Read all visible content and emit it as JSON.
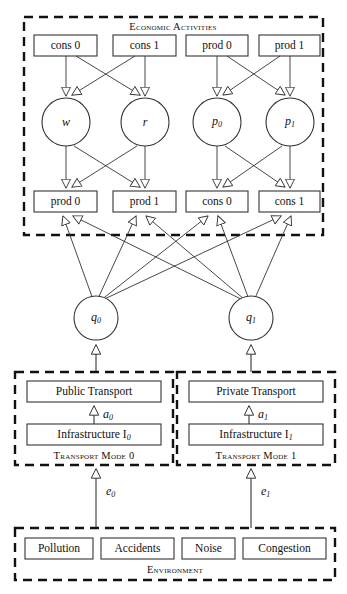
{
  "diagram": {
    "type": "block-flow-diagram",
    "stroke_color": "#333333",
    "dashed_border_color": "#1a1a1a",
    "background": "#ffffff",
    "groups": [
      {
        "id": "economic-activities",
        "title": "Economic Activities",
        "title_position": "top-center"
      },
      {
        "id": "transport-mode-0",
        "title": "Transport Mode 0",
        "title_position": "bottom-center"
      },
      {
        "id": "transport-mode-1",
        "title": "Transport Mode 1",
        "title_position": "bottom-center"
      },
      {
        "id": "environment",
        "title": "Environment",
        "title_position": "bottom-center"
      }
    ],
    "econ_top_row": [
      {
        "id": "cons0-top",
        "label": "cons 0"
      },
      {
        "id": "cons1-top",
        "label": "cons 1"
      },
      {
        "id": "prod0-top",
        "label": "prod 0"
      },
      {
        "id": "prod1-top",
        "label": "prod 1"
      }
    ],
    "econ_mid_row": [
      {
        "id": "w",
        "label": "w",
        "sub": ""
      },
      {
        "id": "r",
        "label": "r",
        "sub": ""
      },
      {
        "id": "p0",
        "label": "p",
        "sub": "0"
      },
      {
        "id": "p1",
        "label": "p",
        "sub": "1"
      }
    ],
    "econ_bottom_row": [
      {
        "id": "prod0-bot",
        "label": "prod 0"
      },
      {
        "id": "prod1-bot",
        "label": "prod 1"
      },
      {
        "id": "cons0-bot",
        "label": "cons 0"
      },
      {
        "id": "cons1-bot",
        "label": "cons 1"
      }
    ],
    "quantity_nodes": [
      {
        "id": "q0",
        "label": "q",
        "sub": "0"
      },
      {
        "id": "q1",
        "label": "q",
        "sub": "1"
      }
    ],
    "transport_modes": [
      {
        "id": "mode0",
        "service": "Public Transport",
        "infrastructure": "Infrastructure I",
        "infrastructure_sub": "0",
        "caption": "Transport Mode 0",
        "internal_edge_label": "a",
        "internal_edge_sub": "0"
      },
      {
        "id": "mode1",
        "service": "Private Transport",
        "infrastructure": "Infrastructure I",
        "infrastructure_sub": "1",
        "caption": "Transport Mode 1",
        "internal_edge_label": "a",
        "internal_edge_sub": "1"
      }
    ],
    "environment_items": [
      {
        "id": "pollution",
        "label": "Pollution"
      },
      {
        "id": "accidents",
        "label": "Accidents"
      },
      {
        "id": "noise",
        "label": "Noise"
      },
      {
        "id": "congestion",
        "label": "Congestion"
      }
    ],
    "environment_edges": [
      {
        "id": "e0",
        "label": "e",
        "sub": "0"
      },
      {
        "id": "e1",
        "label": "e",
        "sub": "1"
      }
    ]
  }
}
